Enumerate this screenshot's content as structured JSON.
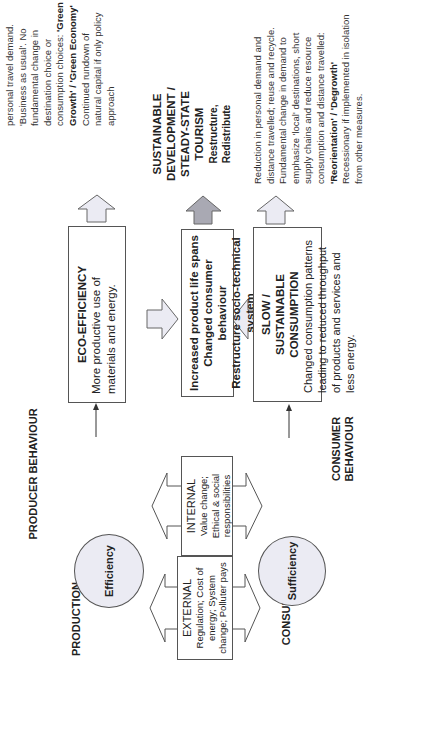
{
  "rows": {
    "production_label": "PRODUCTION",
    "drivers_label": "DRIVERS FOR CHANGE",
    "consumption_label": "CONSUMPTION"
  },
  "behaviour": {
    "producer": "PRODUCER BEHAVIOUR",
    "consumer": "CONSUMER BEHAVIOUR"
  },
  "ellipses": {
    "efficiency": "Efficiency",
    "sufficiency": "Sufficiency"
  },
  "drivers": {
    "external": {
      "title": "EXTERNAL",
      "body": "Regulation; Cost of energy; System change; Polluter pays"
    },
    "internal": {
      "title": "INTERNAL",
      "body": "Value change; Ethical & social responsibilities"
    }
  },
  "boxes": {
    "eco_efficiency": {
      "title": "ECO-EFFICIENCY",
      "body": "More productive use of materials and energy."
    },
    "centre": {
      "lines": [
        "Increased product life spans",
        "Changed consumer behaviour",
        "Restructure socio-technical system"
      ]
    },
    "slow_consumption": {
      "title": "SLOW / SUSTAINABLE CONSUMPTION",
      "body": "Changed consumption patterns leading to reduced throughput of products and services and less energy."
    }
  },
  "outcomes": {
    "production_text": {
      "intro": "personal travel demand. 'Business as usual'. No fundamental change in destination choice or consumption choices:",
      "bold": "'Green Growth' / 'Green Economy'",
      "tail": "Continued rundown of natural capital if only policy approach"
    },
    "goal": {
      "title": "SUSTAINABLE DEVELOPMENT / STEADY-STATE TOURISM",
      "subtitle": "Restructure, Redistribute"
    },
    "consumption_text": {
      "intro": "Reduction in personal demand and distance travelled; reuse and recycle. Fundamental change in demand to emphasize 'local' destinations, short supply chains and reduce resource consumption and distance travelled:",
      "bold": "'Reorientation' / 'Degrowth'",
      "tail": "Recessionary if implemented in isolation from other measures."
    }
  },
  "colors": {
    "arrow_fill_light": "#ebebf3",
    "arrow_fill_dark": "#a9a9b3",
    "ellipse_fill": "#ebebf3",
    "border": "#555555"
  }
}
